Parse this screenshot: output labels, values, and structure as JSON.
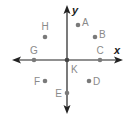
{
  "diagram": {
    "type": "coordinate-plane",
    "axes": {
      "x_label": "x",
      "y_label": "y",
      "origin": {
        "px": 67,
        "py": 60
      },
      "x_range_px": [
        12,
        123
      ],
      "y_range_px": [
        5,
        114
      ]
    },
    "colors": {
      "axis": "#222222",
      "point": "#7a7a7a",
      "label": "#8a8a8a"
    },
    "points": [
      {
        "name": "A",
        "px": 78,
        "py": 25,
        "lx": 82,
        "ly": 26,
        "anchor": "start"
      },
      {
        "name": "B",
        "px": 95,
        "py": 37,
        "lx": 99,
        "ly": 38,
        "anchor": "start"
      },
      {
        "name": "C",
        "px": 100,
        "py": 60,
        "lx": 100,
        "ly": 54,
        "anchor": "middle"
      },
      {
        "name": "D",
        "px": 89,
        "py": 81,
        "lx": 93,
        "ly": 85,
        "anchor": "start"
      },
      {
        "name": "E",
        "px": 67,
        "py": 93,
        "lx": 62,
        "ly": 97,
        "anchor": "end"
      },
      {
        "name": "F",
        "px": 45,
        "py": 81,
        "lx": 40,
        "ly": 85,
        "anchor": "end"
      },
      {
        "name": "G",
        "px": 34,
        "py": 60,
        "lx": 34,
        "ly": 54,
        "anchor": "middle"
      },
      {
        "name": "H",
        "px": 45,
        "py": 37,
        "lx": 45,
        "ly": 30,
        "anchor": "middle"
      },
      {
        "name": "K",
        "px": 67,
        "py": 60,
        "lx": 71,
        "ly": 73,
        "anchor": "start"
      }
    ]
  }
}
